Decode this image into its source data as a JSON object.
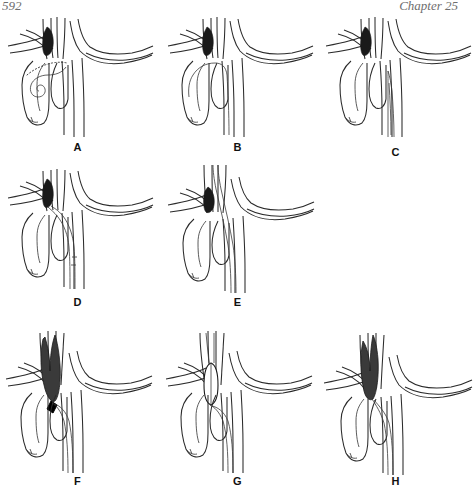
{
  "running_head": {
    "left": "592",
    "right": "Chapter 25"
  },
  "figure": {
    "panels": [
      {
        "id": "A",
        "label": "A",
        "caption_text": "Aortic arch with catheter looped in ascending aorta; dark stenotic lesion at origin of left common carotid artery"
      },
      {
        "id": "B",
        "label": "B",
        "caption_text": "Guidewire advanced across the aortic arch"
      },
      {
        "id": "C",
        "label": "C",
        "caption_text": "Tapered catheter advanced from the descending aorta"
      },
      {
        "id": "D",
        "label": "D",
        "caption_text": "Sheath advanced into the left common carotid artery"
      },
      {
        "id": "E",
        "label": "E",
        "caption_text": "Sheath advanced further up the carotid artery across the lesion"
      },
      {
        "id": "F",
        "label": "F",
        "caption_text": "Embolic protection device deployed distally, arrowhead marker at lesion"
      },
      {
        "id": "G",
        "label": "G",
        "caption_text": "Balloon expanded at the stenotic lesion site"
      },
      {
        "id": "H",
        "label": "H",
        "caption_text": "Final deployed stent within the carotid artery"
      }
    ]
  },
  "colors": {
    "vessel_outline": "#2b2b2b",
    "lesion_fill": "#1a1a1a",
    "device_fill": "#3a3a3a",
    "background": "#ffffff",
    "label_text": "#111111",
    "running_head_text": "#6e6e6e"
  }
}
